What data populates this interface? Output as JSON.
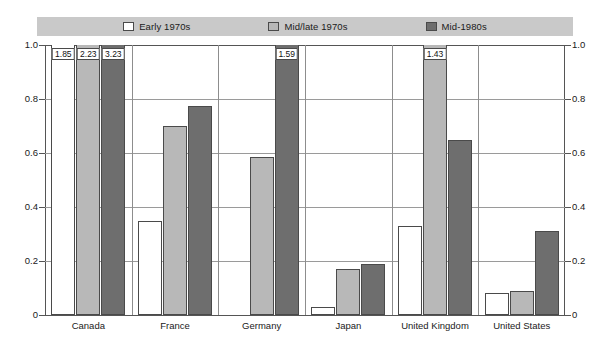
{
  "legend": {
    "entries": [
      {
        "label": "Early 1970s",
        "swatch": "white",
        "color": "#ffffff"
      },
      {
        "label": "Mid/late 1970s",
        "swatch": "light",
        "color": "#b8b8b8"
      },
      {
        "label": "Mid-1980s",
        "swatch": "dark",
        "color": "#6e6e6e"
      }
    ],
    "background": "#c9c9c9"
  },
  "axis": {
    "y_ticks": [
      "1.0",
      "0.8",
      "0.6",
      "0.4",
      "0.2",
      "0"
    ],
    "y_tick_values": [
      1.0,
      0.8,
      0.6,
      0.4,
      0.2,
      0
    ],
    "y_ticks_right": [
      "1.0",
      "0.8",
      "0.6",
      "0.4",
      "0.2",
      "0"
    ],
    "ylim": [
      0,
      1.0
    ]
  },
  "chart_data": {
    "type": "bar",
    "title": "",
    "subtitle": "",
    "xlabel": "",
    "ylabel": "",
    "ylim": [
      0,
      1.0
    ],
    "grid": true,
    "legend_position": "top",
    "clip_note": "Bars exceeding 1.0 are clipped at the axis top and annotated with their true value.",
    "categories": [
      "Canada",
      "France",
      "Germany",
      "Japan",
      "United Kingdom",
      "United States"
    ],
    "series": [
      {
        "name": "Early 1970s",
        "color": "#ffffff",
        "values": [
          1.85,
          0.35,
          null,
          0.03,
          0.33,
          0.08
        ],
        "labels": [
          "1.85",
          "",
          "",
          "",
          "",
          ""
        ]
      },
      {
        "name": "Mid/late 1970s",
        "color": "#b8b8b8",
        "values": [
          2.23,
          0.7,
          0.585,
          0.17,
          1.43,
          0.09
        ],
        "labels": [
          "2.23",
          "",
          "",
          "",
          "1.43",
          ""
        ]
      },
      {
        "name": "Mid-1980s",
        "color": "#6e6e6e",
        "values": [
          3.23,
          0.775,
          1.59,
          0.19,
          0.65,
          0.31
        ],
        "labels": [
          "3.23",
          "",
          "1.59",
          "",
          "",
          ""
        ]
      }
    ]
  }
}
